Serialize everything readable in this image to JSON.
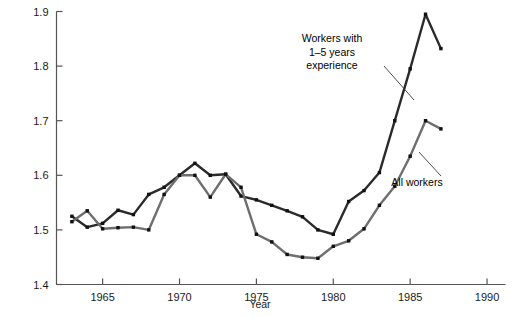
{
  "chart_data": {
    "type": "line",
    "title": "",
    "xlabel": "Year",
    "ylabel": "Ratio of wages of college graduates to high school graduates",
    "xlim": [
      1962,
      1991.2
    ],
    "ylim": [
      1.4,
      1.9
    ],
    "xticks": [
      1965,
      1970,
      1975,
      1980,
      1985,
      1990
    ],
    "xticklabels": [
      "1965",
      "1970",
      "1975",
      "1980",
      "1985",
      "1990"
    ],
    "yticks": [
      1.4,
      1.5,
      1.6,
      1.7,
      1.8,
      1.9
    ],
    "yticklabels": [
      "1.4",
      "1.5",
      "1.6",
      "1.7",
      "1.8",
      "1.9"
    ],
    "grid": false,
    "legend_position": "annotations-inline",
    "markers": "filled-square",
    "series": [
      {
        "name": "Workers with 1–5 years experience",
        "color": "#2b2b2b",
        "x": [
          1963,
          1964,
          1965,
          1966,
          1967,
          1968,
          1969,
          1970,
          1971,
          1972,
          1973,
          1974,
          1975,
          1976,
          1977,
          1978,
          1979,
          1980,
          1981,
          1982,
          1983,
          1984,
          1985,
          1986,
          1987
        ],
        "values": [
          1.525,
          1.505,
          1.512,
          1.536,
          1.528,
          1.565,
          1.578,
          1.6,
          1.622,
          1.6,
          1.602,
          1.562,
          1.555,
          1.545,
          1.535,
          1.524,
          1.5,
          1.492,
          1.552,
          1.572,
          1.605,
          1.7,
          1.795,
          1.895,
          1.832
        ]
      },
      {
        "name": "All workers",
        "color": "#6e6e6e",
        "x": [
          1963,
          1964,
          1965,
          1966,
          1967,
          1968,
          1969,
          1970,
          1971,
          1972,
          1973,
          1974,
          1975,
          1976,
          1977,
          1978,
          1979,
          1980,
          1981,
          1982,
          1983,
          1984,
          1985,
          1986,
          1987
        ],
        "values": [
          1.515,
          1.535,
          1.502,
          1.504,
          1.505,
          1.5,
          1.565,
          1.6,
          1.6,
          1.56,
          1.602,
          1.578,
          1.492,
          1.478,
          1.455,
          1.45,
          1.448,
          1.47,
          1.48,
          1.502,
          1.545,
          1.58,
          1.635,
          1.7,
          1.685
        ]
      }
    ],
    "annotations": [
      {
        "name": "annotation-experienced-workers",
        "lines": [
          "Workers with",
          "1–5 years",
          "experience"
        ],
        "text_x": 332,
        "text_y": 42,
        "leader": {
          "x1": 384,
          "y1": 66,
          "x2": 414,
          "y2": 100
        }
      },
      {
        "name": "annotation-all-workers",
        "lines": [
          "All workers"
        ],
        "text_x": 417,
        "text_y": 186,
        "leader": {
          "x1": 441,
          "y1": 176,
          "x2": 419,
          "y2": 152
        }
      }
    ]
  }
}
